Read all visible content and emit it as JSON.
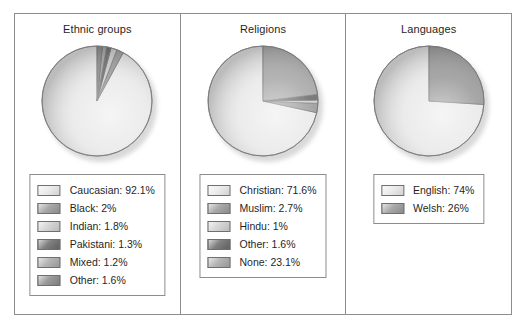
{
  "figure": {
    "background": "#ffffff",
    "frame_color": "#8d8d8d"
  },
  "panels": [
    {
      "key": "ethnic",
      "title": "Ethnic groups",
      "chart_data": {
        "type": "pie",
        "title": "Ethnic groups",
        "categories": [
          "Caucasian",
          "Black",
          "Indian",
          "Pakistani",
          "Mixed",
          "Other"
        ],
        "values": [
          92.1,
          2,
          1.8,
          1.3,
          1.2,
          1.6
        ],
        "unit": "%",
        "colors": [
          "#e9e9e9",
          "#9a9a9a",
          "#cfcfcf",
          "#6a6a6a",
          "#a8a8a8",
          "#8a8a8a"
        ],
        "legend_labels": [
          "Caucasian: 92.1%",
          "Black: 2%",
          "Indian: 1.8%",
          "Pakistani: 1.3%",
          "Mixed: 1.2%",
          "Other: 1.6%"
        ],
        "legend_position": "bottom",
        "start_angle_deg": 90,
        "direction": "counterclockwise"
      }
    },
    {
      "key": "religions",
      "title": "Religions",
      "chart_data": {
        "type": "pie",
        "title": "Religions",
        "categories": [
          "Christian",
          "Muslim",
          "Hindu",
          "Other",
          "None"
        ],
        "values": [
          71.6,
          2.7,
          1,
          1.6,
          23.1
        ],
        "unit": "%",
        "colors": [
          "#e9e9e9",
          "#9a9a9a",
          "#cfcfcf",
          "#6a6a6a",
          "#a8a8a8"
        ],
        "legend_labels": [
          "Christian: 71.6%",
          "Muslim: 2.7%",
          "Hindu: 1%",
          "Other: 1.6%",
          "None: 23.1%"
        ],
        "legend_position": "bottom",
        "start_angle_deg": 90,
        "direction": "counterclockwise"
      }
    },
    {
      "key": "languages",
      "title": "Languages",
      "chart_data": {
        "type": "pie",
        "title": "Languages",
        "categories": [
          "English",
          "Welsh"
        ],
        "values": [
          74,
          26
        ],
        "unit": "%",
        "colors": [
          "#e9e9e9",
          "#9a9a9a"
        ],
        "legend_labels": [
          "English: 74%",
          "Welsh: 26%"
        ],
        "legend_position": "bottom",
        "start_angle_deg": 90,
        "direction": "counterclockwise"
      }
    }
  ]
}
